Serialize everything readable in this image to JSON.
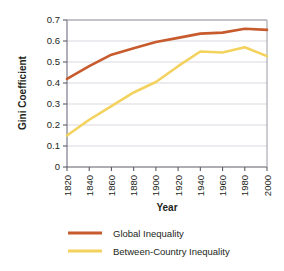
{
  "chart_data": {
    "type": "line",
    "title": "",
    "xlabel": "Year",
    "ylabel": "Gini Coefficient",
    "x": [
      1820,
      1840,
      1860,
      1880,
      1900,
      1920,
      1940,
      1960,
      1980,
      2000
    ],
    "categories": [
      "1820",
      "1840",
      "1860",
      "1880",
      "1900",
      "1920",
      "1940",
      "1960",
      "1980",
      "2000"
    ],
    "xlim": [
      1820,
      2000
    ],
    "ylim": [
      0,
      0.7
    ],
    "yticks": [
      "0",
      "0.1",
      "0.2",
      "0.3",
      "0.4",
      "0.5",
      "0.6",
      "0.7"
    ],
    "ytick_values": [
      0,
      0.1,
      0.2,
      0.3,
      0.4,
      0.5,
      0.6,
      0.7
    ],
    "grid": "horizontal",
    "legend_position": "bottom",
    "series": [
      {
        "name": "Global Inequality",
        "color": "#C75B2E",
        "values": [
          0.42,
          0.48,
          0.535,
          0.565,
          0.595,
          0.615,
          0.635,
          0.64,
          0.658,
          0.653
        ]
      },
      {
        "name": "Between-Country Inequality",
        "color": "#F3D25E",
        "values": [
          0.15,
          0.225,
          0.29,
          0.355,
          0.405,
          0.48,
          0.55,
          0.545,
          0.57,
          0.528
        ]
      }
    ]
  },
  "legend": {
    "items": [
      {
        "label": "Global Inequality",
        "color": "#C75B2E"
      },
      {
        "label": "Between-Country Inequality",
        "color": "#F3D25E"
      }
    ]
  },
  "axes": {
    "x_title": "Year",
    "y_title": "Gini Coefficient"
  }
}
